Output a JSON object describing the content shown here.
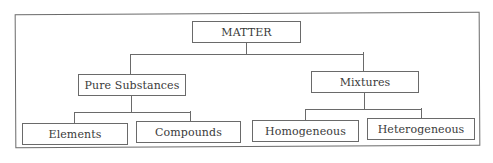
{
  "diagram": {
    "title": "MATTER",
    "root": {
      "label": "MATTER",
      "children": [
        {
          "label": "Pure Substances",
          "children": [
            {
              "label": "Elements"
            },
            {
              "label": "Compounds"
            }
          ]
        },
        {
          "label": "Mixtures",
          "children": [
            {
              "label": "Homogeneous"
            },
            {
              "label": "Heterogeneous"
            }
          ]
        }
      ]
    },
    "colors": {
      "line": "#6a6a6a",
      "text": "#3a3a3a",
      "background": "#ffffff"
    }
  }
}
